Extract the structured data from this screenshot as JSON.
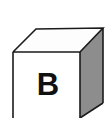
{
  "figure": {
    "name": "labeled-cube",
    "label": "B",
    "background_color": "#ffffff",
    "colors": {
      "front_face": "#ffffff",
      "top_face": "#fdfdfd",
      "right_face": "#8d8d8d",
      "edge_stroke": "#1a1a1a",
      "label_color": "#111111"
    },
    "faces": [
      {
        "name": "top-face",
        "shade": "white",
        "visible": true
      },
      {
        "name": "front-face",
        "shade": "white",
        "visible": true
      },
      {
        "name": "right-face",
        "shade": "gray",
        "visible": true
      }
    ],
    "geometry": {
      "projection": "oblique",
      "front_top_left": "13,52",
      "front_top_right": "80,52",
      "back_top_left": "36,29",
      "back_top_right": "103,28",
      "front_bottom_left": "13,118",
      "front_bottom_right": "80,118",
      "right_bottom_back": "103,103",
      "cropped_edge": "bottom"
    },
    "label_position": {
      "x": 48,
      "y": 95
    }
  }
}
